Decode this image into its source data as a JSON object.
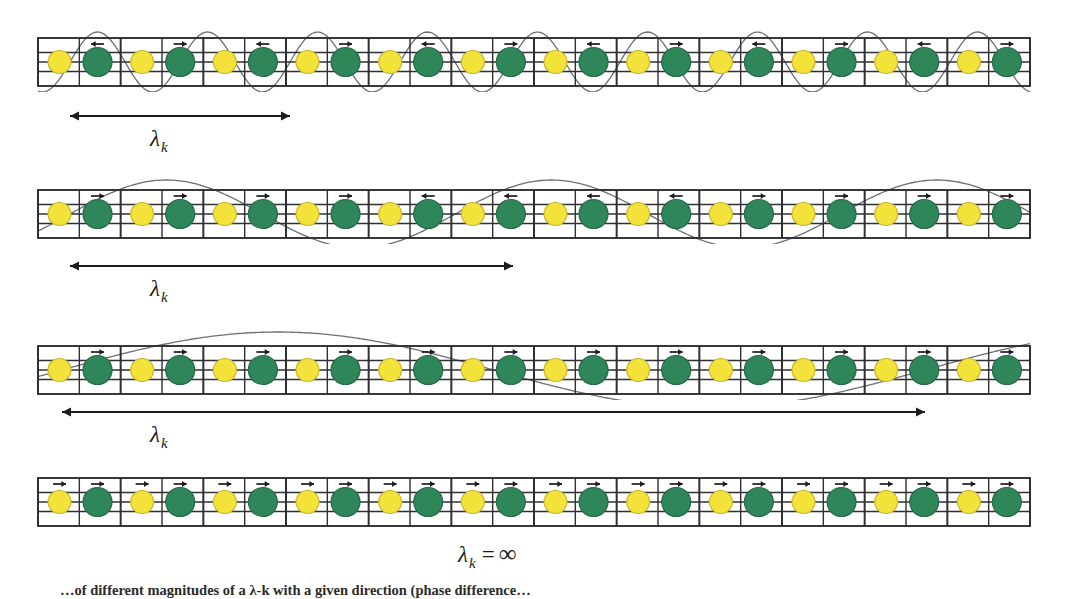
{
  "figure": {
    "kind": "phonon-wavelength-diagram",
    "background": "#ffffff",
    "caption": "…of different magnitudes of a λ-k with a given direction (phase difference…"
  },
  "palette": {
    "atom_a": "#f2e23a",
    "atom_a_stroke": "#c9b62c",
    "atom_b": "#2f8659",
    "atom_b_stroke": "#27694a",
    "grid_line": "#2f2f33",
    "wave_line": "#6b6f78",
    "arrow": "#1b1b20",
    "text": "#1a1a1a"
  },
  "lattice": {
    "cells": 12,
    "atoms_per_cell": 2,
    "left": 38,
    "width": 992,
    "strip_height": 48
  },
  "rows": [
    {
      "id": "row-1",
      "top": 38,
      "wave": {
        "visible": true,
        "periods": 2.0,
        "phase": 0.0,
        "amplitude": 30
      },
      "measure": {
        "visible": true,
        "x1": 70,
        "x2": 290,
        "y": 116,
        "heads": "both"
      },
      "label": {
        "text": "λ",
        "sub": "k",
        "eq": "",
        "value": "",
        "x": 150,
        "y": 126
      },
      "arrow_marks": [
        "left",
        "right",
        "left",
        "right",
        "left",
        "right",
        "left",
        "right",
        "left",
        "right",
        "left",
        "right"
      ]
    },
    {
      "id": "row-2",
      "top": 190,
      "wave": {
        "visible": true,
        "periods": 1.15,
        "phase": 0.0,
        "amplitude": 34
      },
      "measure": {
        "visible": true,
        "x1": 70,
        "x2": 513,
        "y": 266,
        "heads": "both"
      },
      "label": {
        "text": "λ",
        "sub": "k",
        "eq": "",
        "value": "",
        "x": 150,
        "y": 276
      },
      "arrow_marks": [
        "right",
        "right",
        "right",
        "right",
        "left",
        "left",
        "left",
        "left",
        "right",
        "right",
        "right",
        "right"
      ]
    },
    {
      "id": "row-3",
      "top": 346,
      "wave": {
        "visible": true,
        "periods": 1.0,
        "phase": 0.0,
        "amplitude": 38
      },
      "measure": {
        "visible": true,
        "x1": 62,
        "x2": 925,
        "y": 412,
        "heads": "both"
      },
      "label": {
        "text": "λ",
        "sub": "k",
        "eq": "",
        "value": "",
        "x": 150,
        "y": 422
      },
      "arrow_marks": [
        "right",
        "right",
        "right",
        "right",
        "right",
        "right",
        "right",
        "right",
        "right",
        "right",
        "right",
        "right"
      ]
    },
    {
      "id": "row-4",
      "top": 478,
      "wave": {
        "visible": false,
        "periods": 0,
        "phase": 0,
        "amplitude": 0
      },
      "measure": {
        "visible": false,
        "x1": 0,
        "x2": 0,
        "y": 0,
        "heads": "both"
      },
      "label": {
        "text": "λ",
        "sub": "k",
        "eq": "=",
        "value": "∞",
        "x": 458,
        "y": 540
      },
      "arrow_marks": [
        "right",
        "right",
        "right",
        "right",
        "right",
        "right",
        "right",
        "right",
        "right",
        "right",
        "right",
        "right"
      ]
    }
  ]
}
